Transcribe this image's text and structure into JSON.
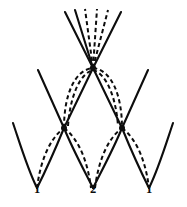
{
  "figure": {
    "background_color": "#ffffff",
    "stroke_color": "#0d0d0d",
    "width": 187,
    "height": 207,
    "labels": [
      {
        "text": "1",
        "x": 37,
        "y": 190
      },
      {
        "text": "2",
        "x": 93,
        "y": 190
      },
      {
        "text": "1",
        "x": 149,
        "y": 190
      }
    ],
    "vertices": [
      {
        "name": "apex",
        "x": 93,
        "y": 68,
        "radius": 3.1
      },
      {
        "name": "left-node",
        "x": 64,
        "y": 128,
        "radius": 3.0
      },
      {
        "name": "right-node",
        "x": 122,
        "y": 128,
        "radius": 3.0
      }
    ],
    "fan_rays": [
      {
        "style": "solid",
        "x2": 65,
        "y2": 12
      },
      {
        "style": "solid",
        "x2": 75,
        "y2": 10
      },
      {
        "style": "dashed",
        "x2": 85,
        "y2": 9
      },
      {
        "style": "dashed",
        "x2": 97,
        "y2": 9
      },
      {
        "style": "dashed",
        "x2": 108,
        "y2": 10
      },
      {
        "style": "solid",
        "x2": 121,
        "y2": 12
      }
    ],
    "solid_paths": [
      "M 64 128 L 93 68 L 122 128",
      "M 38 70 L 64 128",
      "M 148 70 L 122 128",
      "M 13 123 C 22 150 28 170 37 188",
      "M 37 188 C 46 170 55 150 64 128",
      "M 64 128 C 73 150 84 170 93 188",
      "M 93 188 C 102 170 113 150 122 128",
      "M 122 128 C 131 150 140 170 149 188",
      "M 149 188 C 158 170 164 150 173 123"
    ],
    "dashed_paths": [
      "M 64 128 C 64 96 74 70 93 68",
      "M 93 68 C 112 70 122 96 122 128",
      "M 68 126 C 70 98 79 74 93 70",
      "M 93 70 C 107 74 116 98 118 126",
      "M 37 188 C 40 164 48 140 64 128",
      "M 64 128 C 80 140 88 164 91 188",
      "M 95 188 C 98 164 106 140 122 128",
      "M 122 128 C 138 140 146 164 149 188"
    ]
  }
}
